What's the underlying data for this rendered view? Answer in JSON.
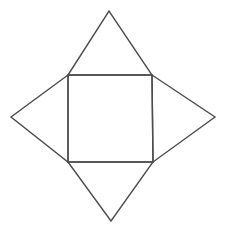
{
  "diagram": {
    "kind": "square-pyramid-net",
    "stroke_color": "#4d4d4d",
    "background": "#ffffff",
    "square": {
      "top_left": [
        68,
        75
      ],
      "top_right": [
        152,
        75
      ],
      "bottom_right": [
        153,
        162
      ],
      "bottom_left": [
        68,
        162
      ]
    },
    "triangles": [
      {
        "name": "top",
        "base": [
          [
            68,
            75
          ],
          [
            152,
            75
          ]
        ],
        "apex": [
          109,
          11
        ]
      },
      {
        "name": "right",
        "base": [
          [
            152,
            75
          ],
          [
            153,
            162
          ]
        ],
        "apex": [
          215,
          117
        ]
      },
      {
        "name": "bottom",
        "base": [
          [
            68,
            162
          ],
          [
            153,
            162
          ]
        ],
        "apex": [
          111,
          221
        ]
      },
      {
        "name": "left",
        "base": [
          [
            68,
            75
          ],
          [
            68,
            162
          ]
        ],
        "apex": [
          11,
          117
        ]
      }
    ]
  }
}
